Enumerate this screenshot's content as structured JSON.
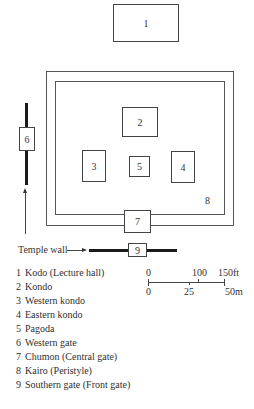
{
  "diagram": {
    "buildings": [
      {
        "id": "1",
        "label": "1"
      },
      {
        "id": "2",
        "label": "2"
      },
      {
        "id": "3",
        "label": "3"
      },
      {
        "id": "4",
        "label": "4"
      },
      {
        "id": "5",
        "label": "5"
      },
      {
        "id": "6",
        "label": "6"
      },
      {
        "id": "7",
        "label": "7"
      },
      {
        "id": "8",
        "label": "8"
      },
      {
        "id": "9",
        "label": "9"
      }
    ],
    "temple_wall_label": "Temple wall"
  },
  "scale": {
    "ft_labels": [
      "0",
      "100",
      "150ft"
    ],
    "m_labels": [
      "0",
      "25",
      "50m"
    ]
  },
  "legend": [
    {
      "num": "1",
      "text": "Kodo (Lecture hall)"
    },
    {
      "num": "2",
      "text": "Kondo"
    },
    {
      "num": "3",
      "text": "Western kondo"
    },
    {
      "num": "4",
      "text": "Eastern kondo"
    },
    {
      "num": "5",
      "text": "Pagoda"
    },
    {
      "num": "6",
      "text": "Western gate"
    },
    {
      "num": "7",
      "text": "Chumon (Central gate)"
    },
    {
      "num": "8",
      "text": "Kairo (Peristyle)"
    },
    {
      "num": "9",
      "text": "Southern gate (Front gate)"
    }
  ]
}
